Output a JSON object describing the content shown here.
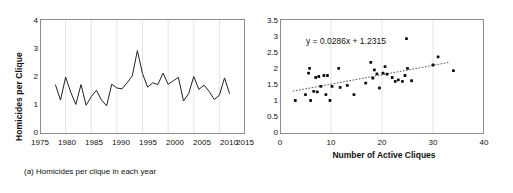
{
  "figure": {
    "background": "#ffffff",
    "ink": "#111111",
    "gridline_color": "#e4e4e4",
    "axis_color": "#8c8c8c"
  },
  "panel_a": {
    "caption": "(a) Homicides per clique in each year",
    "ylabel": "Homicides per Clique",
    "y_ticks": [
      "0",
      "1",
      "2",
      "3",
      "4"
    ],
    "x_ticks": [
      "1975",
      "1980",
      "1985",
      "1990",
      "1995",
      "2000",
      "2005",
      "2010",
      "2015"
    ]
  },
  "panel_b": {
    "caption": "(b) Homicides per clique plotted against the number of\nactive cliques identified in each year from 1978-2012",
    "xlabel": "Number of Active Cliques",
    "equation": "y = 0.0286x + 1.2315",
    "y_ticks": [
      "0",
      "0.5",
      "1",
      "1.5",
      "2",
      "2.5",
      "3",
      "3.5"
    ],
    "x_ticks": [
      "0",
      "10",
      "20",
      "30",
      "40"
    ]
  },
  "chart_data": [
    {
      "type": "line",
      "panel": "a",
      "title": "",
      "caption": "(a) Homicides per clique in each year",
      "xlabel": "",
      "ylabel": "Homicides per Clique",
      "xlim": [
        1975,
        2015
      ],
      "ylim": [
        0,
        4
      ],
      "xticks": [
        1975,
        1980,
        1985,
        1990,
        1995,
        2000,
        2005,
        2010,
        2015
      ],
      "yticks": [
        0,
        1,
        2,
        3,
        4
      ],
      "grid": "vertical",
      "legend": "none",
      "line_color": "#222222",
      "x": [
        1978,
        1979,
        1980,
        1981,
        1982,
        1983,
        1984,
        1985,
        1986,
        1987,
        1988,
        1989,
        1990,
        1991,
        1992,
        1993,
        1994,
        1995,
        1996,
        1997,
        1998,
        1999,
        2000,
        2001,
        2002,
        2003,
        2004,
        2005,
        2006,
        2007,
        2008,
        2009,
        2010,
        2011,
        2012
      ],
      "values": [
        1.72,
        1.18,
        1.98,
        1.45,
        1.03,
        1.72,
        1.0,
        1.3,
        1.52,
        1.18,
        0.98,
        1.73,
        1.6,
        1.57,
        1.78,
        2.02,
        2.9,
        2.1,
        1.63,
        1.78,
        1.72,
        2.12,
        1.73,
        1.85,
        1.97,
        1.15,
        1.4,
        2.0,
        1.55,
        1.7,
        1.48,
        1.2,
        1.35,
        1.95,
        1.4
      ]
    },
    {
      "type": "scatter",
      "panel": "b",
      "title": "",
      "caption": "(b) Homicides per clique plotted against the number of active cliques identified in each year from 1978-2012",
      "xlabel": "Number of Active Cliques",
      "ylabel": "",
      "xlim": [
        0,
        40
      ],
      "ylim": [
        0,
        3.5
      ],
      "xticks": [
        0,
        10,
        20,
        30,
        40
      ],
      "yticks": [
        0,
        0.5,
        1,
        1.5,
        2,
        2.5,
        3,
        3.5
      ],
      "grid": "vertical",
      "legend": "none",
      "marker_color": "#111111",
      "annotation": "y = 0.0286x + 1.2315",
      "trendline": {
        "slope": 0.0286,
        "intercept": 1.2315,
        "x_start": 2.5,
        "x_end": 33.0,
        "style": "dotted",
        "color": "#555555"
      },
      "points": [
        {
          "x": 3.0,
          "y": 1.02
        },
        {
          "x": 5.0,
          "y": 1.2
        },
        {
          "x": 5.6,
          "y": 1.85
        },
        {
          "x": 5.8,
          "y": 2.0
        },
        {
          "x": 6.0,
          "y": 1.02
        },
        {
          "x": 6.6,
          "y": 1.3
        },
        {
          "x": 7.0,
          "y": 1.72
        },
        {
          "x": 7.3,
          "y": 1.28
        },
        {
          "x": 7.6,
          "y": 1.75
        },
        {
          "x": 8.0,
          "y": 1.45
        },
        {
          "x": 8.6,
          "y": 1.78
        },
        {
          "x": 9.0,
          "y": 1.2
        },
        {
          "x": 9.3,
          "y": 1.78
        },
        {
          "x": 9.8,
          "y": 1.02
        },
        {
          "x": 10.2,
          "y": 1.45
        },
        {
          "x": 11.5,
          "y": 2.0
        },
        {
          "x": 11.8,
          "y": 1.42
        },
        {
          "x": 13.2,
          "y": 1.48
        },
        {
          "x": 14.5,
          "y": 1.2
        },
        {
          "x": 16.8,
          "y": 1.55
        },
        {
          "x": 17.8,
          "y": 2.18
        },
        {
          "x": 18.2,
          "y": 1.7
        },
        {
          "x": 18.5,
          "y": 1.95
        },
        {
          "x": 19.0,
          "y": 1.83
        },
        {
          "x": 19.5,
          "y": 1.4
        },
        {
          "x": 20.2,
          "y": 1.85
        },
        {
          "x": 20.6,
          "y": 2.05
        },
        {
          "x": 21.0,
          "y": 1.82
        },
        {
          "x": 22.0,
          "y": 1.72
        },
        {
          "x": 22.6,
          "y": 1.6
        },
        {
          "x": 23.2,
          "y": 1.65
        },
        {
          "x": 24.0,
          "y": 1.6
        },
        {
          "x": 24.5,
          "y": 1.78
        },
        {
          "x": 24.8,
          "y": 2.9
        },
        {
          "x": 25.0,
          "y": 2.0
        },
        {
          "x": 25.8,
          "y": 1.62
        },
        {
          "x": 30.0,
          "y": 2.1
        },
        {
          "x": 31.0,
          "y": 2.35
        },
        {
          "x": 34.0,
          "y": 1.93
        }
      ]
    }
  ]
}
